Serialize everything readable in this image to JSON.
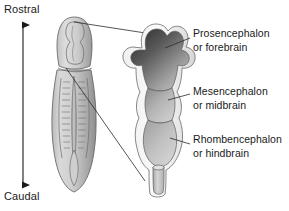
{
  "figure": {
    "type": "anatomical-diagram",
    "background_color": "#ffffff",
    "ink_color": "#1a1a1a"
  },
  "axis": {
    "name": "rostrocaudal-axis",
    "orientation": "vertical",
    "arrowheads": "both",
    "top_label": "Rostral",
    "bottom_label": "Caudal"
  },
  "labels": [
    {
      "id": "prosencephalon",
      "line1": "Prosencephalon",
      "line2": "or forebrain",
      "leader": "from text left edge to upper vesicle"
    },
    {
      "id": "mesencephalon",
      "line1": "Mesencephalon",
      "line2": "or midbrain",
      "leader": "from text left edge to middle vesicle"
    },
    {
      "id": "rhombencephalon",
      "line1": "Rhombencephalon",
      "line2": "or hindbrain",
      "leader": "from text left edge to lower vesicle"
    }
  ],
  "embryo": {
    "name": "neural-tube-embryo",
    "description": "Dorsal view of embryo with neural groove, somites flanking midline, rounded caudal end",
    "fill_light": "#d8d8d8",
    "fill_mid": "#b4b4b4",
    "fill_dark": "#8f8f8f"
  },
  "vesicles": {
    "name": "primary-brain-vesicles",
    "description": "Enlarged cutaway of the three primary brain vesicles with spinal cord stub",
    "parts": [
      {
        "id": "forebrain-vesicle",
        "shading": "dark gradient",
        "dark": "#3a3a3a",
        "light": "#bdbdbd"
      },
      {
        "id": "midbrain-vesicle",
        "shading": "medium gradient",
        "dark": "#9a9a9a",
        "light": "#cfcfcf"
      },
      {
        "id": "hindbrain-vesicle",
        "shading": "light gradient",
        "dark": "#a8a8a8",
        "light": "#d4d4d4"
      },
      {
        "id": "spinal-cord-stub",
        "shading": "light",
        "dark": "#b0b0b0",
        "light": "#dcdcdc"
      }
    ]
  },
  "connectors": {
    "name": "magnification-leaders",
    "count": 2,
    "description": "Two lines linking the embryo head region to the enlarged vesicle drawing"
  }
}
